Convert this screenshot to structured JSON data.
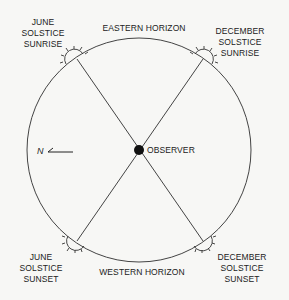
{
  "horizons": {
    "east": "EASTERN HORIZON",
    "west": "WESTERN HORIZON"
  },
  "observer": {
    "label": "OBSERVER"
  },
  "compass": {
    "label": "N"
  },
  "events": [
    {
      "id": "june-sunrise",
      "lines": [
        "JUNE",
        "SOLSTICE",
        "SUNRISE"
      ]
    },
    {
      "id": "december-sunrise",
      "lines": [
        "DECEMBER",
        "SOLSTICE",
        "SUNRISE"
      ]
    },
    {
      "id": "june-sunset",
      "lines": [
        "JUNE",
        "SOLSTICE",
        "SUNSET"
      ]
    },
    {
      "id": "december-sunset",
      "lines": [
        "DECEMBER",
        "SOLSTICE",
        "SUNSET"
      ]
    }
  ],
  "colors": {
    "ink": "#333333",
    "background": "#f7f7f5"
  }
}
